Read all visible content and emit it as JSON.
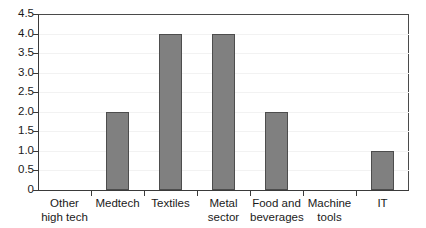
{
  "chart_data": {
    "type": "bar",
    "title": "",
    "subtitle": "",
    "xlabel": "",
    "ylabel": "",
    "categories": [
      "Other high tech",
      "Medtech",
      "Textiles",
      "Metal sector",
      "Food and beverages",
      "Machine tools",
      "IT"
    ],
    "category_lines": [
      [
        "Other",
        "high tech"
      ],
      [
        "Medtech",
        ""
      ],
      [
        "Textiles",
        ""
      ],
      [
        "Metal",
        "sector"
      ],
      [
        "Food and",
        "beverages"
      ],
      [
        "Machine",
        "tools"
      ],
      [
        "IT",
        ""
      ]
    ],
    "values": [
      0,
      2.0,
      4.0,
      4.0,
      2.0,
      0,
      1.0
    ],
    "ylim": [
      0,
      4.5
    ],
    "ytick_values": [
      0,
      0.5,
      1.0,
      1.5,
      2.0,
      2.5,
      3.0,
      3.5,
      4.0,
      4.5
    ],
    "ytick_labels": [
      "0",
      "0.5",
      "1.0",
      "1.5",
      "2.0",
      "2.5",
      "3.0",
      "3.5",
      "4.0",
      "4.5"
    ],
    "grid": true,
    "legend": null,
    "legend_position": "none",
    "colors": {
      "bar_fill": "#808080",
      "bar_edge": "#4d4d4d",
      "axis": "#3a3a3a",
      "frame": "#4a4a4a",
      "gridline": "#f2f2f2",
      "text": "#1a1a1a",
      "background": "#ffffff"
    }
  }
}
